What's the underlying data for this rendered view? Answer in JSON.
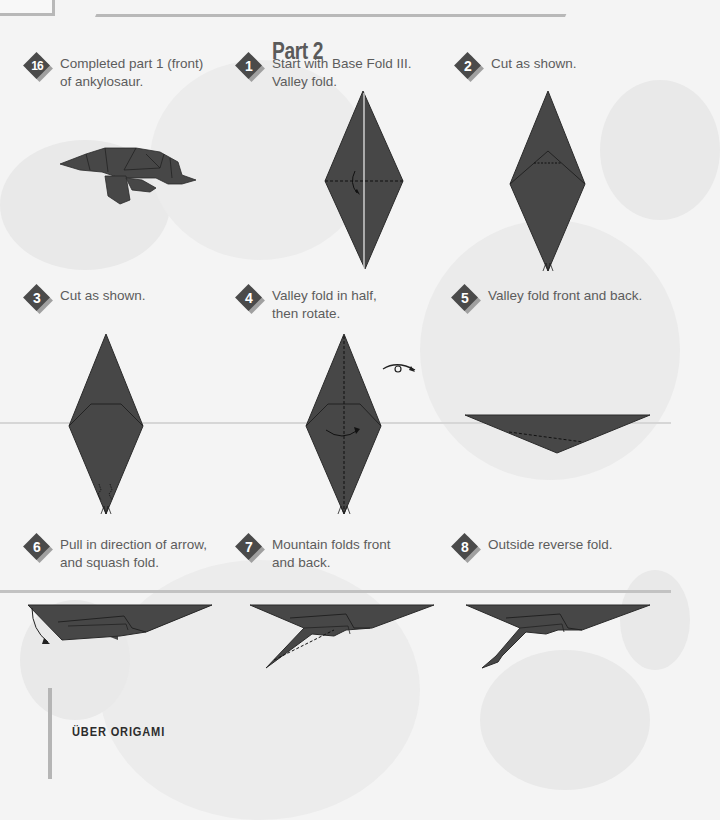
{
  "page": {
    "section_title": "Part 2",
    "footer_title": "ÜBER ORIGAMI",
    "colors": {
      "paper": "#474747",
      "background": "#f4f4f4",
      "badge": "#4a4a4a",
      "rule": "#c2c2c2"
    }
  },
  "steps": [
    {
      "number": "16",
      "text": "Completed part 1 (front)\nof ankylosaur.",
      "diagram": "ankylosaur-front-icon"
    },
    {
      "number": "1",
      "text": "Start with Base Fold III.\nValley fold.",
      "diagram": "diamond-base-fold-icon"
    },
    {
      "number": "2",
      "text": "Cut as shown.",
      "diagram": "diamond-cut-icon"
    },
    {
      "number": "3",
      "text": "Cut as shown.",
      "diagram": "diamond-cut-bottom-icon"
    },
    {
      "number": "4",
      "text": "Valley fold in half,\nthen rotate.",
      "diagram": "diamond-fold-half-icon"
    },
    {
      "number": "5",
      "text": "Valley fold front and back.",
      "diagram": "triangle-valley-fold-icon"
    },
    {
      "number": "6",
      "text": "Pull in direction of arrow,\nand squash fold.",
      "diagram": "squash-fold-icon"
    },
    {
      "number": "7",
      "text": "Mountain folds front\nand back.",
      "diagram": "mountain-fold-icon"
    },
    {
      "number": "8",
      "text": "Outside reverse fold.",
      "diagram": "outside-reverse-fold-icon"
    }
  ]
}
